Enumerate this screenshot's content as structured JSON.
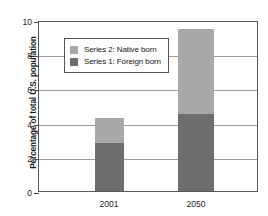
{
  "chart_data": {
    "type": "bar",
    "subtype": "stacked-bar",
    "title": "",
    "xlabel": "",
    "ylabel": "Percentage of total U.S. population",
    "categories": [
      "2001",
      "2050"
    ],
    "series": [
      {
        "name": "Series 1: Foreign born",
        "values": [
          2.8,
          4.5
        ],
        "color": "#6e6e6e"
      },
      {
        "name": "Series 2: Native born",
        "values": [
          1.45,
          5.0
        ],
        "color": "#a8a8a8"
      }
    ],
    "totals": [
      4.25,
      9.5
    ],
    "ylim": [
      0,
      10
    ],
    "yticks": [
      0,
      2,
      4,
      6,
      8,
      10
    ],
    "ytick_labels": [
      "0",
      "2",
      "4",
      "6",
      "8",
      "10"
    ],
    "grid": true,
    "legend_position": "upper-left-inside",
    "legend_entries": [
      {
        "label": "Series 2: Native born",
        "color": "#a8a8a8"
      },
      {
        "label": "Series 1: Foreign born",
        "color": "#6e6e6e"
      }
    ]
  },
  "axis": {
    "y_title": "Percentage of total U.S. population"
  },
  "colors": {
    "native_born": "#a8a8a8",
    "foreign_born": "#6e6e6e",
    "frame": "#5a5a5a",
    "gridline": "#9a9a9a",
    "background": "#ffffff"
  }
}
